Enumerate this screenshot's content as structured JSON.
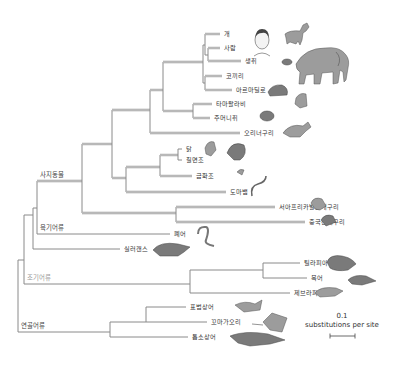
{
  "figure": {
    "type": "phylogenetic-tree",
    "scale_bar": {
      "value": "0.1",
      "unit": "substitutions per site"
    }
  },
  "clades": {
    "tetrapods": "사지동물",
    "lobe_finned": "육기어류",
    "ray_finned": "조기어류",
    "cartilaginous": "연골어류"
  },
  "taxa": [
    {
      "id": "dog",
      "label": "개"
    },
    {
      "id": "human",
      "label": "사람"
    },
    {
      "id": "mouse",
      "label": "생쥐"
    },
    {
      "id": "elephant",
      "label": "코끼리"
    },
    {
      "id": "armadillo",
      "label": "아르마딜로"
    },
    {
      "id": "wallaby",
      "label": "타마왈라비"
    },
    {
      "id": "opossum",
      "label": "주머니쥐"
    },
    {
      "id": "platypus",
      "label": "오리너구리"
    },
    {
      "id": "chicken",
      "label": "닭"
    },
    {
      "id": "turkey",
      "label": "칠면조"
    },
    {
      "id": "zebra_finch",
      "label": "금화조"
    },
    {
      "id": "lizard",
      "label": "도마뱀"
    },
    {
      "id": "xenopus",
      "label": "서아프리카발톱개구리"
    },
    {
      "id": "chinese_frog",
      "label": "중국산개구리"
    },
    {
      "id": "lungfish",
      "label": "폐어"
    },
    {
      "id": "coelacanth",
      "label": "실러캔스"
    },
    {
      "id": "tilapia",
      "label": "틸라피아"
    },
    {
      "id": "pufferfish",
      "label": "복어"
    },
    {
      "id": "zebrafish",
      "label": "제브라피시"
    },
    {
      "id": "leopard_shark",
      "label": "표범상어"
    },
    {
      "id": "little_skate",
      "label": "꼬마가오리"
    },
    {
      "id": "sawshark",
      "label": "톱소상어"
    }
  ],
  "colors": {
    "branch": "#8a8a8a",
    "label": "#333333",
    "clade_label_ray_finned": "#9a9a9a"
  }
}
